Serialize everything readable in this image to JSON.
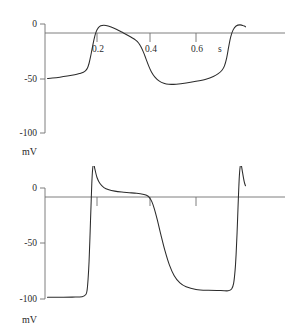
{
  "figure": {
    "title": "",
    "background_color": "#ffffff",
    "trace_color": "#2b2b2b",
    "axis_color": "#6f6f6f"
  },
  "chart_data": [
    {
      "type": "line",
      "title": "",
      "subtitle": "",
      "panel_name": "slow-response-action-potential",
      "xlabel": "s",
      "ylabel": "mV",
      "xlim": [
        0.0,
        0.8
      ],
      "ylim": [
        -100,
        10
      ],
      "grid": false,
      "legend": null,
      "x_ticks": [
        0.2,
        0.4,
        0.6
      ],
      "x_tick_labels": [
        "0.2",
        "0.4",
        "0.6"
      ],
      "y_ticks": [
        0,
        -50,
        -100
      ],
      "y_tick_labels": [
        "0",
        "-50",
        "-100"
      ],
      "annotations": [
        "s",
        "mV"
      ],
      "series": [
        {
          "name": "membrane potential",
          "x": [
            0.0,
            0.02,
            0.05,
            0.08,
            0.11,
            0.13,
            0.145,
            0.155,
            0.162,
            0.168,
            0.174,
            0.18,
            0.188,
            0.196,
            0.205,
            0.215,
            0.228,
            0.245,
            0.262,
            0.28,
            0.3,
            0.32,
            0.34,
            0.355,
            0.368,
            0.378,
            0.388,
            0.398,
            0.408,
            0.42,
            0.435,
            0.452,
            0.47,
            0.49,
            0.52,
            0.56,
            0.6,
            0.64,
            0.67,
            0.69,
            0.705,
            0.715,
            0.724,
            0.732,
            0.74,
            0.75,
            0.762,
            0.778,
            0.795,
            0.8
          ],
          "y": [
            -50.0,
            -49.6,
            -48.8,
            -47.8,
            -46.6,
            -45.4,
            -44.2,
            -42.6,
            -40.2,
            -36.0,
            -30.0,
            -23.0,
            -14.0,
            -7.5,
            -3.6,
            -1.7,
            -1.2,
            -1.8,
            -3.2,
            -5.0,
            -7.4,
            -9.8,
            -12.4,
            -14.6,
            -17.4,
            -21.0,
            -26.0,
            -32.0,
            -38.0,
            -44.0,
            -49.0,
            -52.4,
            -54.4,
            -55.3,
            -55.2,
            -54.2,
            -52.6,
            -50.6,
            -48.2,
            -45.6,
            -42.4,
            -38.4,
            -31.0,
            -21.0,
            -12.0,
            -5.4,
            -1.8,
            -0.8,
            -1.9,
            -2.6
          ],
          "color": "#2b2b2b"
        }
      ]
    },
    {
      "type": "line",
      "title": "",
      "subtitle": "",
      "panel_name": "fast-response-action-potential",
      "xlabel": "",
      "ylabel": "mV",
      "xlim": [
        0.0,
        0.8
      ],
      "ylim": [
        -100,
        25
      ],
      "grid": false,
      "legend": null,
      "x_ticks": [
        0.2,
        0.4,
        0.6
      ],
      "x_tick_labels": [
        "",
        "",
        ""
      ],
      "y_ticks": [
        0,
        -50,
        -100
      ],
      "y_tick_labels": [
        "0",
        "-50",
        "-100"
      ],
      "annotations": [
        "mV"
      ],
      "series": [
        {
          "name": "membrane potential",
          "x": [
            0.0,
            0.05,
            0.1,
            0.14,
            0.155,
            0.16,
            0.164,
            0.168,
            0.171,
            0.174,
            0.1765,
            0.179,
            0.182,
            0.186,
            0.192,
            0.2,
            0.212,
            0.228,
            0.248,
            0.272,
            0.3,
            0.33,
            0.36,
            0.385,
            0.4,
            0.412,
            0.422,
            0.432,
            0.444,
            0.458,
            0.474,
            0.492,
            0.512,
            0.535,
            0.56,
            0.6,
            0.65,
            0.7,
            0.73,
            0.744,
            0.752,
            0.758,
            0.762,
            0.766,
            0.77,
            0.7725,
            0.775,
            0.778,
            0.782,
            0.788,
            0.795,
            0.8
          ],
          "y": [
            -98.5,
            -98.4,
            -98.3,
            -98.0,
            -96.0,
            -92.0,
            -82.0,
            -66.0,
            -48.0,
            -28.0,
            -12.0,
            4.0,
            16.0,
            22.0,
            16.5,
            9.5,
            4.0,
            0.4,
            -1.6,
            -2.8,
            -3.6,
            -4.2,
            -4.8,
            -5.6,
            -6.6,
            -8.6,
            -12.5,
            -19.0,
            -29.0,
            -42.0,
            -56.0,
            -69.0,
            -79.0,
            -85.5,
            -89.0,
            -91.4,
            -92.2,
            -92.4,
            -92.6,
            -91.0,
            -86.0,
            -74.0,
            -60.0,
            -40.0,
            -16.0,
            -2.0,
            10.0,
            18.5,
            21.5,
            14.0,
            5.5,
            2.0
          ],
          "color": "#2b2b2b"
        }
      ]
    }
  ],
  "panels": {
    "top": {
      "y_labels": {
        "zero": "0",
        "minus_fifty": "-50",
        "minus_hundred": "-100"
      },
      "x_labels": {
        "t02": "0.2",
        "t04": "0.4",
        "t06": "0.6"
      },
      "x_unit": "s",
      "y_unit": "mV"
    },
    "bottom": {
      "y_labels": {
        "zero": "0",
        "minus_fifty": "-50",
        "minus_hundred": "-100"
      },
      "y_unit": "mV"
    }
  }
}
